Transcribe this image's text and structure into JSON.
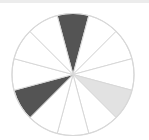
{
  "diagram": {
    "type": "segmented-circle",
    "segment_count": 12,
    "start_angle_deg": -15,
    "center": [
      73,
      74.5
    ],
    "radius": 61,
    "colors": {
      "dark": "#545454",
      "light": "#e2e2e2",
      "empty": "#ffffff",
      "stroke": "#d8d8d8",
      "top_bar": "#ececec"
    },
    "segments": [
      {
        "index": 0,
        "from_deg": -15,
        "to_deg": 15,
        "fill": "dark"
      },
      {
        "index": 1,
        "from_deg": 15,
        "to_deg": 45,
        "fill": "empty"
      },
      {
        "index": 2,
        "from_deg": 45,
        "to_deg": 75,
        "fill": "empty"
      },
      {
        "index": 3,
        "from_deg": 75,
        "to_deg": 105,
        "fill": "empty"
      },
      {
        "index": 4,
        "from_deg": 105,
        "to_deg": 135,
        "fill": "light"
      },
      {
        "index": 5,
        "from_deg": 135,
        "to_deg": 165,
        "fill": "empty"
      },
      {
        "index": 6,
        "from_deg": 165,
        "to_deg": 195,
        "fill": "empty"
      },
      {
        "index": 7,
        "from_deg": 195,
        "to_deg": 225,
        "fill": "empty"
      },
      {
        "index": 8,
        "from_deg": 225,
        "to_deg": 255,
        "fill": "dark"
      },
      {
        "index": 9,
        "from_deg": 255,
        "to_deg": 285,
        "fill": "empty"
      },
      {
        "index": 10,
        "from_deg": 285,
        "to_deg": 315,
        "fill": "empty"
      },
      {
        "index": 11,
        "from_deg": 315,
        "to_deg": 345,
        "fill": "empty"
      }
    ]
  }
}
